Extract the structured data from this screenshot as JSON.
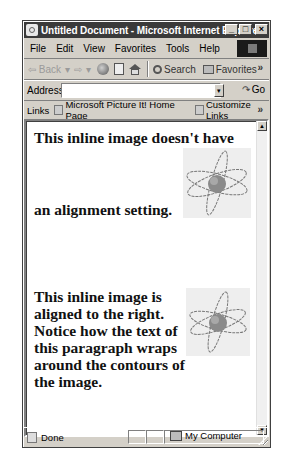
{
  "window": {
    "title": "Untitled Document - Microsoft Internet Explorer",
    "controls": {
      "minimize": "_",
      "maximize": "□",
      "close": "×"
    }
  },
  "menu": {
    "items": [
      {
        "label": "File"
      },
      {
        "label": "Edit"
      },
      {
        "label": "View"
      },
      {
        "label": "Favorites"
      },
      {
        "label": "Tools"
      },
      {
        "label": "Help"
      }
    ]
  },
  "toolbar": {
    "back_label": "Back",
    "back_dropdown": "▾",
    "forward_glyph": "⇨",
    "forward_dropdown": "▾",
    "back_glyph": "⇦",
    "search_label": "Search",
    "favorites_label": "Favorites",
    "overflow": "»"
  },
  "address": {
    "label": "Address",
    "value": "",
    "dropdown": "▾",
    "go_label": "Go",
    "go_glyph": "↷"
  },
  "links": {
    "label": "Links",
    "items": [
      {
        "label": "Microsoft Picture It! Home Page"
      },
      {
        "label": "Customize Links"
      }
    ],
    "overflow": "»"
  },
  "content": {
    "paragraph1_line1": "This inline image doesn't have",
    "paragraph1_line2": "an alignment setting.",
    "paragraph2": "This inline image is aligned to the right. Notice how the text of this paragraph wraps around the contours of the image.",
    "images": [
      {
        "alt": "atom-graphic",
        "alignment": "none"
      },
      {
        "alt": "atom-graphic",
        "alignment": "right"
      }
    ]
  },
  "scrollbar": {
    "up": "▲",
    "down": "▼"
  },
  "status": {
    "text": "Done",
    "zone": "My Computer"
  }
}
